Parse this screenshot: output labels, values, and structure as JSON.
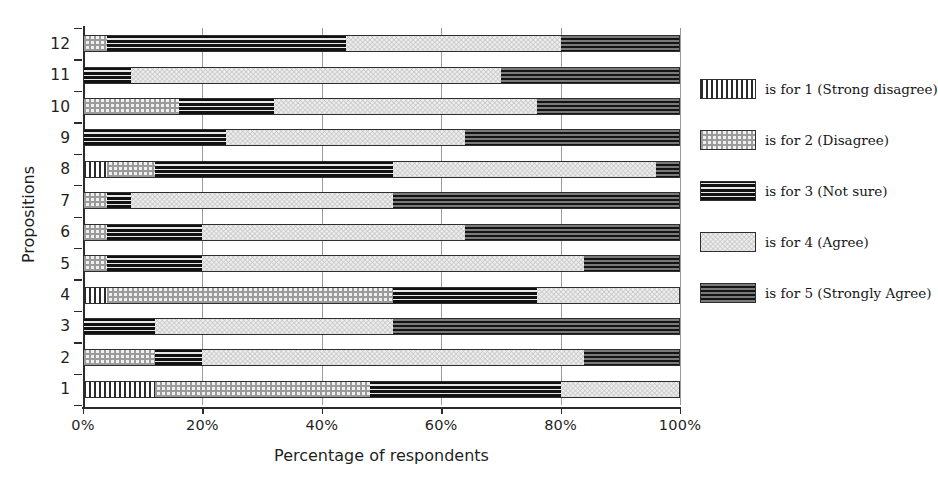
{
  "chart_data": {
    "type": "bar",
    "orientation": "horizontal",
    "stacked": true,
    "normalized_percent": true,
    "title": "",
    "xlabel": "Percentage of respondents",
    "ylabel": "Propositions",
    "xlim": [
      0,
      100
    ],
    "xticks": [
      0,
      20,
      40,
      60,
      80,
      100
    ],
    "xtick_labels": [
      "0%",
      "20%",
      "40%",
      "60%",
      "80%",
      "100%"
    ],
    "grid": "vertical-only",
    "legend_position": "right",
    "categories": [
      "1",
      "2",
      "3",
      "4",
      "5",
      "6",
      "7",
      "8",
      "9",
      "10",
      "11",
      "12"
    ],
    "series": [
      {
        "name": "is for 1 (Strong disagree)",
        "key": "strong-disagree",
        "pattern": "vertical-stripes",
        "values": [
          12,
          0,
          0,
          4,
          0,
          0,
          0,
          4,
          0,
          0,
          0,
          0
        ]
      },
      {
        "name": "is for 2 (Disagree)",
        "key": "disagree",
        "pattern": "checkerboard",
        "values": [
          36,
          12,
          0,
          48,
          4,
          4,
          4,
          8,
          0,
          16,
          0,
          4
        ]
      },
      {
        "name": "is for 3 (Not sure)",
        "key": "not-sure",
        "pattern": "horizontal-lines",
        "values": [
          32,
          8,
          12,
          24,
          16,
          16,
          4,
          40,
          24,
          16,
          8,
          40
        ]
      },
      {
        "name": "is for 4 (Agree)",
        "key": "agree",
        "pattern": "zigzag",
        "values": [
          20,
          64,
          40,
          24,
          64,
          44,
          44,
          44,
          40,
          44,
          62,
          36
        ]
      },
      {
        "name": "is for 5 (Strongly Agree)",
        "key": "strongly-agree",
        "pattern": "dark-dotted",
        "values": [
          0,
          16,
          48,
          0,
          16,
          36,
          48,
          4,
          36,
          24,
          30,
          20
        ]
      }
    ],
    "bars": [
      {
        "category": "1",
        "segments": [
          12,
          36,
          32,
          20,
          0
        ]
      },
      {
        "category": "2",
        "segments": [
          0,
          12,
          8,
          64,
          16
        ]
      },
      {
        "category": "3",
        "segments": [
          0,
          0,
          12,
          40,
          48
        ]
      },
      {
        "category": "4",
        "segments": [
          4,
          48,
          24,
          24,
          0
        ]
      },
      {
        "category": "5",
        "segments": [
          0,
          4,
          16,
          64,
          16
        ]
      },
      {
        "category": "6",
        "segments": [
          0,
          4,
          16,
          44,
          36
        ]
      },
      {
        "category": "7",
        "segments": [
          0,
          4,
          4,
          44,
          48
        ]
      },
      {
        "category": "8",
        "segments": [
          4,
          8,
          40,
          44,
          4
        ]
      },
      {
        "category": "9",
        "segments": [
          0,
          0,
          24,
          40,
          36
        ]
      },
      {
        "category": "10",
        "segments": [
          0,
          16,
          16,
          44,
          24
        ]
      },
      {
        "category": "11",
        "segments": [
          0,
          0,
          8,
          62,
          30
        ]
      },
      {
        "category": "12",
        "segments": [
          0,
          4,
          40,
          36,
          20
        ]
      }
    ]
  },
  "axes": {
    "x": {
      "label": "Percentage of respondents",
      "ticks": [
        "0%",
        "20%",
        "40%",
        "60%",
        "80%",
        "100%"
      ]
    },
    "y": {
      "label": "Propositions",
      "ticks": [
        "1",
        "2",
        "3",
        "4",
        "5",
        "6",
        "7",
        "8",
        "9",
        "10",
        "11",
        "12"
      ]
    }
  },
  "legend": {
    "items": [
      {
        "label": "is for 1 (Strong disagree)",
        "pattern": "vertical-stripes"
      },
      {
        "label": "is for 2 (Disagree)",
        "pattern": "checkerboard"
      },
      {
        "label": "is for 3 (Not sure)",
        "pattern": "horizontal-lines"
      },
      {
        "label": "is for 4 (Agree)",
        "pattern": "zigzag"
      },
      {
        "label": "is for 5 (Strongly Agree)",
        "pattern": "dark-dotted"
      }
    ]
  },
  "colors": {
    "ink": "#1a1a1a",
    "axis": "#2b2b2b",
    "grid": "#9a9a9a",
    "background": "#ffffff"
  }
}
